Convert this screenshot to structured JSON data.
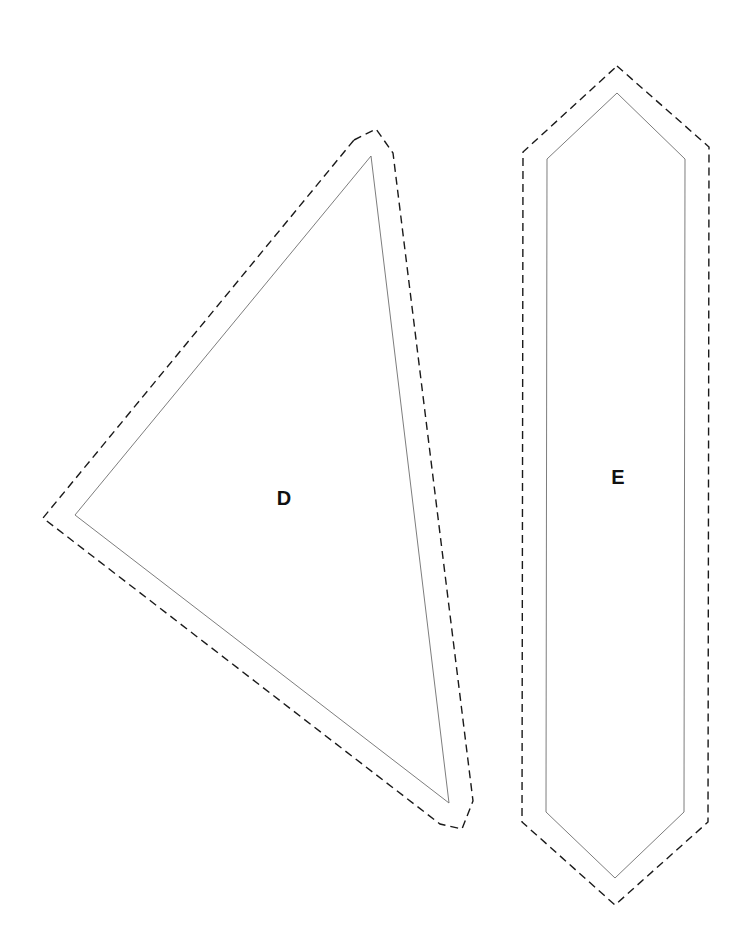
{
  "pattern": {
    "pieces": [
      {
        "id": "D",
        "label": "D",
        "shape": "triangle",
        "label_position": [
          284,
          498
        ],
        "sew_line": [
          [
            371,
            156
          ],
          [
            75,
            515
          ],
          [
            449,
            803
          ]
        ],
        "cut_line": [
          [
            354,
            140
          ],
          [
            376,
            129
          ],
          [
            393,
            153
          ],
          [
            473,
            801
          ],
          [
            462,
            829
          ],
          [
            440,
            824
          ],
          [
            43,
            518
          ]
        ]
      },
      {
        "id": "E",
        "label": "E",
        "shape": "elongated-hexagon",
        "label_position": [
          618,
          477
        ],
        "sew_line": [
          [
            617,
            93
          ],
          [
            685,
            159
          ],
          [
            684,
            812
          ],
          [
            615,
            878
          ],
          [
            546,
            812
          ],
          [
            547,
            159
          ]
        ],
        "cut_line": [
          [
            617,
            66
          ],
          [
            709,
            147
          ],
          [
            708,
            822
          ],
          [
            615,
            905
          ],
          [
            522,
            822
          ],
          [
            523,
            152
          ]
        ]
      }
    ],
    "colors": {
      "cut_line": "#1a1a1a",
      "sew_line": "#6e6e6e",
      "background": "#ffffff"
    }
  }
}
